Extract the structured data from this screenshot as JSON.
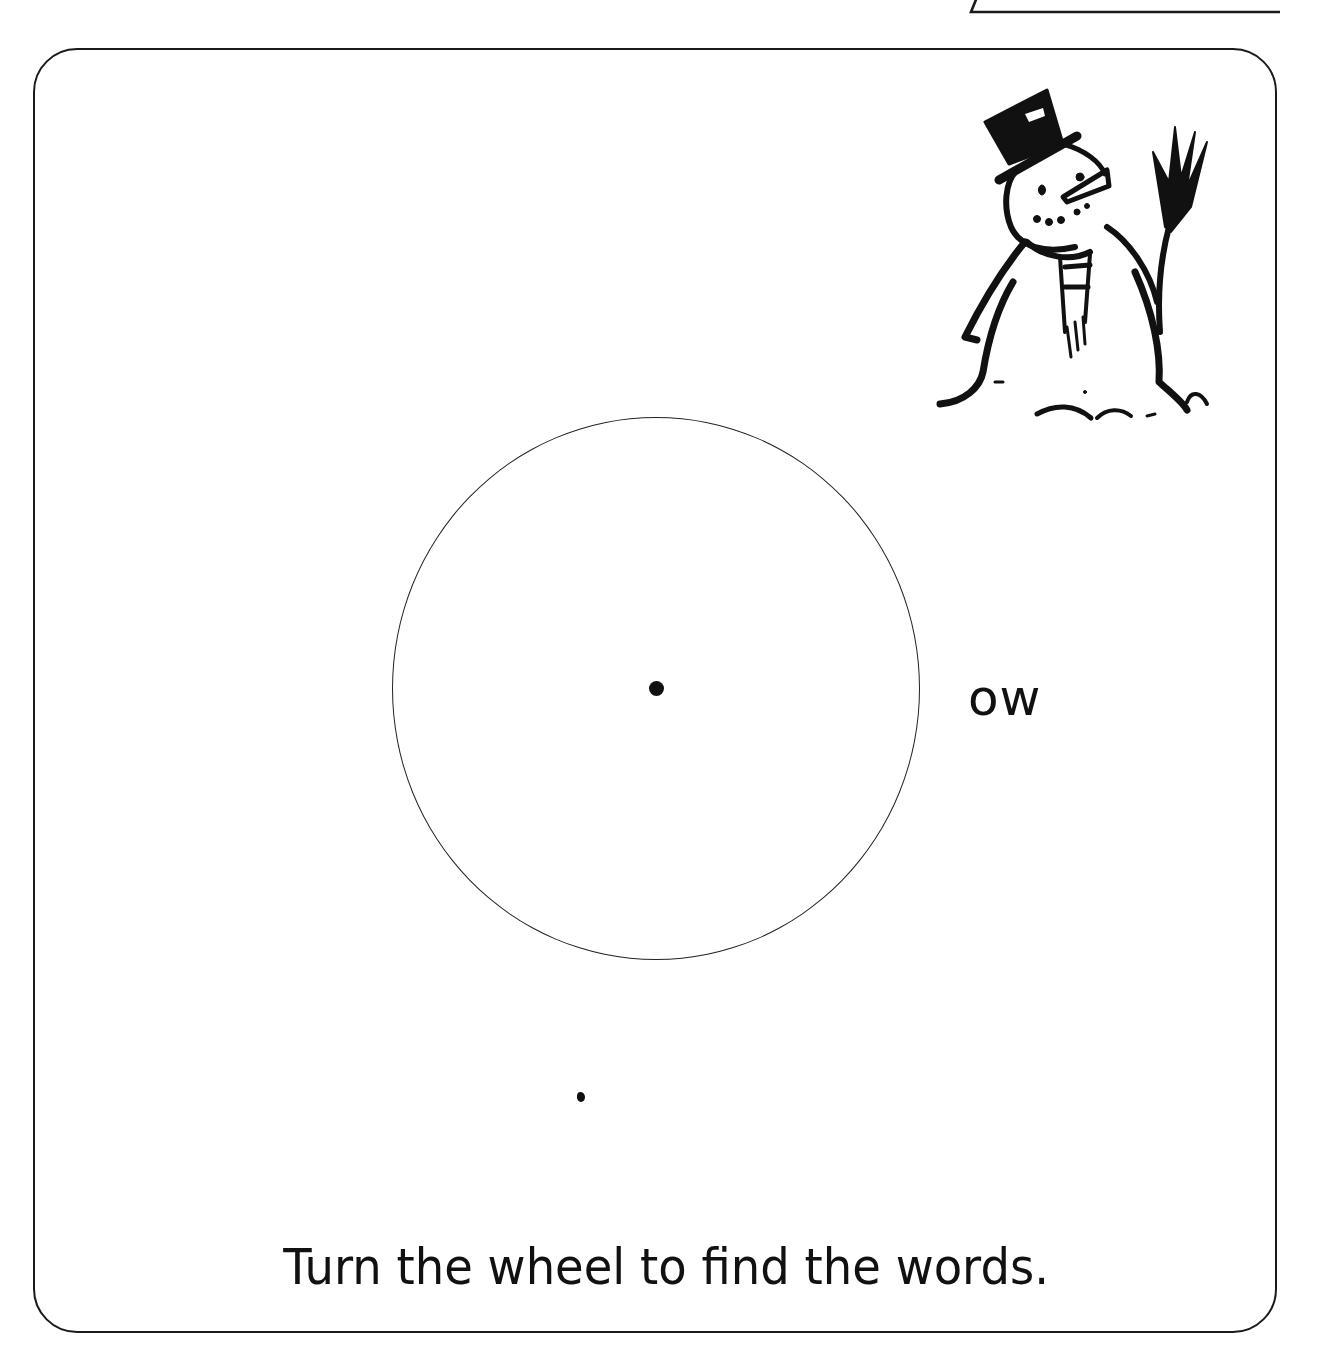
{
  "worksheet": {
    "header_tab": {
      "text": "",
      "clipped": true
    },
    "illustration": {
      "icon": "snowman-icon",
      "description": "Snowman with top hat, carrot nose, scarf and broom"
    },
    "word_wheel": {
      "shape": "circle",
      "center_marker": "pivot-dot",
      "letters": []
    },
    "suffix": "ow",
    "instruction": "Turn the wheel to find the words.",
    "colors": {
      "ink": "#111111",
      "background": "#ffffff"
    }
  }
}
